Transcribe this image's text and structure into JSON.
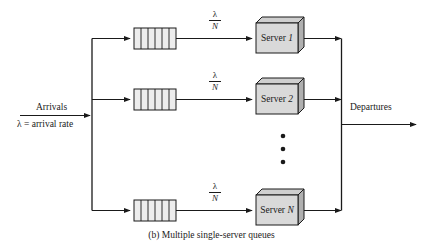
{
  "figure": {
    "caption": "(b) Multiple single-server queues",
    "arrivals_label": "Arrivals",
    "arrival_rate_label": "λ = arrival rate",
    "departures_label": "Departures",
    "ellipsis_dots": 3
  },
  "colors": {
    "line": "#1a1a1a",
    "box_fill": "#d9d9d9",
    "box_top_fill": "#cfcfcf",
    "box_side_fill": "#b0b0b0",
    "queue_fill": "#ededed",
    "background": "#ffffff"
  },
  "branch_rate": {
    "numerator": "λ",
    "denominator": "N"
  },
  "rows": [
    {
      "id": "row-1",
      "queue_name": "queue-1",
      "queue_slots": 6,
      "rate_label": "λ/N",
      "server_name": "Server 1",
      "server_prefix": "Server ",
      "server_index": "1"
    },
    {
      "id": "row-2",
      "queue_name": "queue-2",
      "queue_slots": 6,
      "rate_label": "λ/N",
      "server_name": "Server 2",
      "server_prefix": "Server ",
      "server_index": "2"
    },
    {
      "id": "row-n",
      "queue_name": "queue-n",
      "queue_slots": 6,
      "rate_label": "λ/N",
      "server_name": "Server N",
      "server_prefix": "Server ",
      "server_index": "N"
    }
  ]
}
